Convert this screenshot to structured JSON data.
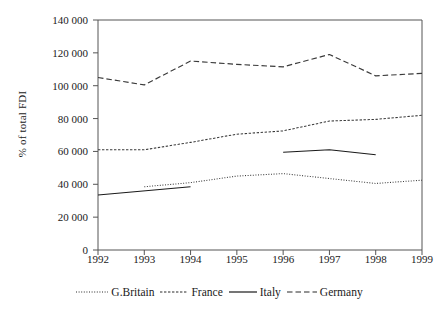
{
  "chart_data": {
    "type": "line",
    "title": "",
    "xlabel": "",
    "ylabel": "% of total FDI",
    "x": [
      1992,
      1993,
      1994,
      1995,
      1996,
      1997,
      1998,
      1999
    ],
    "xtick_labels": [
      "1992",
      "1993",
      "1994",
      "1995",
      "1996",
      "1997",
      "1998",
      "1999"
    ],
    "ytick_labels": [
      "0",
      "20 000",
      "40 000",
      "60 000",
      "80 000",
      "100 000",
      "120 000",
      "140 000"
    ],
    "ytick_values": [
      0,
      20000,
      40000,
      60000,
      80000,
      100000,
      120000,
      140000
    ],
    "ylim": [
      0,
      140000
    ],
    "xlim": [
      1992,
      1999
    ],
    "grid": false,
    "legend_position": "bottom",
    "series": [
      {
        "name": "G.Britain",
        "style": "dotted",
        "color": "#3a3a3a",
        "x": [
          1993,
          1994,
          1995,
          1996,
          1997,
          1998,
          1999
        ],
        "values": [
          38500,
          41000,
          45000,
          46500,
          43500,
          40500,
          42500
        ]
      },
      {
        "name": "France",
        "style": "dashed-short",
        "color": "#3a3a3a",
        "x": [
          1992,
          1993,
          1994,
          1995,
          1996,
          1997,
          1998,
          1999
        ],
        "values": [
          61000,
          61000,
          65500,
          70500,
          72500,
          78500,
          79500,
          82000
        ]
      },
      {
        "name": "Italy",
        "style": "solid",
        "color": "#1a1a1a",
        "segments": [
          {
            "x": [
              1992,
              1994
            ],
            "values": [
              33500,
              38500
            ]
          },
          {
            "x": [
              1996,
              1997,
              1998
            ],
            "values": [
              59500,
              61000,
              58000
            ]
          }
        ]
      },
      {
        "name": "Germany",
        "style": "dashed-long",
        "color": "#3a3a3a",
        "x": [
          1992,
          1993,
          1994,
          1995,
          1996,
          1997,
          1998,
          1999
        ],
        "values": [
          105000,
          100500,
          115000,
          113000,
          111500,
          119000,
          106000,
          107500
        ]
      }
    ]
  },
  "axis": {
    "ylabel": "% of total FDI"
  },
  "legend": {
    "items": [
      {
        "label": "G.Britain",
        "style": "dotted"
      },
      {
        "label": "France",
        "style": "dashed-short"
      },
      {
        "label": "Italy",
        "style": "solid"
      },
      {
        "label": "Germany",
        "style": "dashed-long"
      }
    ]
  }
}
